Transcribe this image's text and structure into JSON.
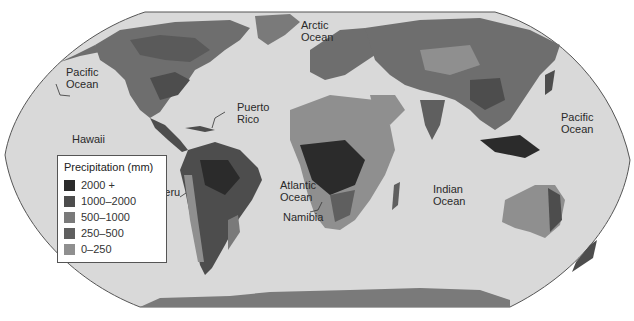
{
  "map": {
    "title": "World annual precipitation",
    "projection": "Robinson",
    "colors": {
      "ocean": "#d9d9d9",
      "background": "#ffffff",
      "outline": "#555555"
    }
  },
  "legend": {
    "title": "Precipitation (mm)",
    "items": [
      {
        "label": "2000 +",
        "color": "#2b2b2b"
      },
      {
        "label": "1000–2000",
        "color": "#4d4d4d"
      },
      {
        "label": "500–1000",
        "color": "#7a7a7a"
      },
      {
        "label": "250–500",
        "color": "#5f5f5f"
      },
      {
        "label": "0–250",
        "color": "#8f8f8f"
      }
    ]
  },
  "labels": {
    "pacific_west": [
      "Pacific",
      "Ocean"
    ],
    "pacific_east": [
      "Pacific",
      "Ocean"
    ],
    "arctic": [
      "Arctic",
      "Ocean"
    ],
    "atlantic": [
      "Atlantic",
      "Ocean"
    ],
    "indian": [
      "Indian",
      "Ocean"
    ],
    "hawaii": "Hawaii",
    "puerto_rico": [
      "Puerto",
      "Rico"
    ],
    "peru": "Peru",
    "namibia": "Namibia"
  }
}
